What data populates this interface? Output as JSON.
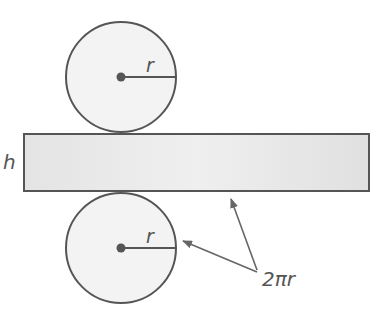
{
  "diagram": {
    "labels": {
      "top_radius": "r",
      "height": "h",
      "bottom_radius": "r",
      "circumference": "2πr"
    },
    "colors": {
      "stroke": "#555555",
      "fill": "#f2f2f2",
      "rect_fill": "#e6e6e6"
    }
  }
}
